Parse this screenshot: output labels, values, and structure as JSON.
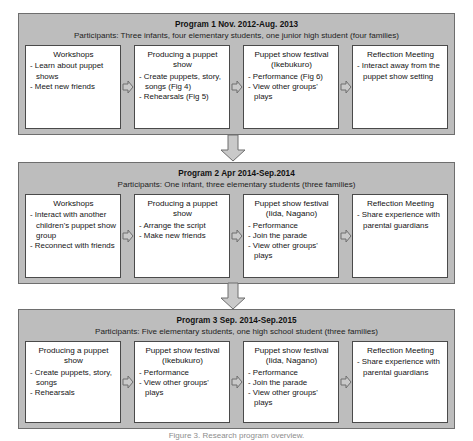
{
  "figure": {
    "caption": "Figure 3. Research program overview."
  },
  "colors": {
    "panel_fill": "#bdbdbd",
    "panel_border": "#6e6e6e",
    "box_fill": "#ffffff",
    "box_border": "#4a4a4a",
    "arrow_fill": "#c9c9c9",
    "arrow_border": "#6e6e6e",
    "text": "#1a1a1a"
  },
  "programs": [
    {
      "id": "program-1",
      "title": "Program 1 Nov. 2012-Aug. 2013",
      "participants": "Participants: Three infants, four elementary students, one junior high student (four families)",
      "stages": [
        {
          "name": "workshops",
          "title": "Workshops",
          "items": [
            "- Learn about puppet shows",
            "- Meet new friends"
          ]
        },
        {
          "name": "producing-a-puppet-show",
          "title": "Producing a puppet show",
          "items": [
            "- Create puppets, story, songs (Fig 4)",
            "- Rehearsals (Fig 5)"
          ]
        },
        {
          "name": "puppet-show-festival-ikebukuro",
          "title": "Puppet show festival (Ikebukuro)",
          "items": [
            "- Performance (Fig 6)",
            "- View other groups' plays"
          ]
        },
        {
          "name": "reflection-meeting",
          "title": "Reflection Meeting",
          "items": [
            "- Interact away from the puppet show setting"
          ]
        }
      ]
    },
    {
      "id": "program-2",
      "title": "Program 2 Apr 2014-Sep.2014",
      "participants": "Participants: One infant, three elementary students (three families)",
      "stages": [
        {
          "name": "workshops",
          "title": "Workshops",
          "items": [
            "- Interact with another children's puppet show group",
            "- Reconnect with friends"
          ]
        },
        {
          "name": "producing-a-puppet-show",
          "title": "Producing a puppet show",
          "items": [
            "- Arrange the script",
            "- Make new friends"
          ]
        },
        {
          "name": "puppet-show-festival-iida-nagano",
          "title": "Puppet show festival (Iida, Nagano)",
          "items": [
            "- Performance",
            "- Join the parade",
            "- View other groups' plays"
          ]
        },
        {
          "name": "reflection-meeting",
          "title": "Reflection Meeting",
          "items": [
            "- Share experience with parental guardians"
          ]
        }
      ]
    },
    {
      "id": "program-3",
      "title": "Program 3 Sep. 2014-Sep.2015",
      "participants": "Participants: Five elementary students, one high school student (three families)",
      "stages": [
        {
          "name": "producing-a-puppet-show",
          "title": "Producing a puppet show",
          "items": [
            "- Create puppets, story, songs",
            "- Rehearsals"
          ]
        },
        {
          "name": "puppet-show-festival-ikebukuro",
          "title": "Puppet show festival (Ikebukuro)",
          "items": [
            "- Performance",
            "- View other groups' plays"
          ]
        },
        {
          "name": "puppet-show-festival-iida-nagano",
          "title": "Puppet show festival (Iida, Nagano)",
          "items": [
            "- Performance",
            "- Join the parade",
            "- View other groups' plays"
          ]
        },
        {
          "name": "reflection-meeting",
          "title": "Reflection Meeting",
          "items": [
            "- Share experience with parental guardians"
          ]
        }
      ]
    }
  ]
}
